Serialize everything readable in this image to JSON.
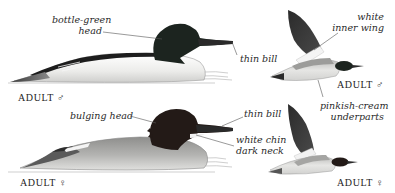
{
  "figure": {
    "panels": [
      {
        "id": "male-swimming",
        "caption": "ADULT ♂",
        "annotations": [
          {
            "text_line1": "bottle-green",
            "text_line2": "head"
          },
          {
            "text_line1": "thin bill"
          }
        ]
      },
      {
        "id": "male-flying",
        "caption": "ADULT ♂",
        "annotations": [
          {
            "text_line1": "white",
            "text_line2": "inner wing"
          },
          {
            "text_line1": "pinkish-cream",
            "text_line2": "underparts"
          }
        ]
      },
      {
        "id": "female-swimming",
        "caption": "ADULT ♀",
        "annotations": [
          {
            "text_line1": "bulging head"
          },
          {
            "text_line1": "thin bill"
          },
          {
            "text_line1": "white chin",
            "text_line2": "dark neck"
          }
        ]
      },
      {
        "id": "female-flying",
        "caption": "ADULT ♀"
      }
    ]
  },
  "colors": {
    "male_head": "#1c241f",
    "female_head": "#231a17",
    "body_white": "#f2f2ef",
    "body_grey": "#a8a8a6",
    "back_black": "#1d1d1d",
    "bill": "#2a2a2a",
    "water": "#c9c9c9",
    "leader": "#555555"
  }
}
